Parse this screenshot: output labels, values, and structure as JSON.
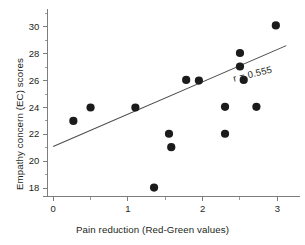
{
  "chart_data": {
    "type": "scatter",
    "title": "",
    "subtitle": "",
    "xlabel": "Pain reduction (Red-Green values)",
    "ylabel": "Empathy concern (EC) scores",
    "xlim": [
      -0.15,
      3.25
    ],
    "ylim": [
      16.9,
      31.1
    ],
    "grid": false,
    "legend": null,
    "x_ticks_major": [
      0,
      1,
      2,
      3
    ],
    "x_tick_labels": [
      "0",
      "1",
      "2",
      "3"
    ],
    "x_ticks_minor": [
      0.5,
      1.5,
      2.5
    ],
    "y_ticks_major": [
      18,
      20,
      22,
      24,
      26,
      28,
      30
    ],
    "y_tick_labels": [
      "18",
      "20",
      "22",
      "24",
      "26",
      "28",
      "30"
    ],
    "y_ticks_minor": [
      19,
      21,
      23,
      25,
      27,
      29,
      31
    ],
    "point_color": "#1b1b1b",
    "point_radius": 4.1,
    "axis_color": "#7d7d7d",
    "trend_color": "#4a4a4a",
    "points": [
      {
        "x": 0.27,
        "y": 23.0
      },
      {
        "x": 0.5,
        "y": 24.0
      },
      {
        "x": 1.1,
        "y": 24.0
      },
      {
        "x": 1.35,
        "y": 18.05
      },
      {
        "x": 1.55,
        "y": 22.05
      },
      {
        "x": 1.58,
        "y": 21.05
      },
      {
        "x": 1.78,
        "y": 26.05
      },
      {
        "x": 1.95,
        "y": 26.0
      },
      {
        "x": 2.3,
        "y": 24.05
      },
      {
        "x": 2.3,
        "y": 22.05
      },
      {
        "x": 2.5,
        "y": 28.05
      },
      {
        "x": 2.5,
        "y": 27.05
      },
      {
        "x": 2.55,
        "y": 26.05
      },
      {
        "x": 2.72,
        "y": 24.05
      },
      {
        "x": 2.98,
        "y": 30.1
      }
    ],
    "trend_line": {
      "x_start": 0.0,
      "y_start": 21.1,
      "x_end": 3.12,
      "y_end": 28.6
    },
    "annotations": [
      {
        "text": "r = 0.555",
        "x": 2.72,
        "y": 27.1,
        "rotation": -13.5
      }
    ]
  }
}
